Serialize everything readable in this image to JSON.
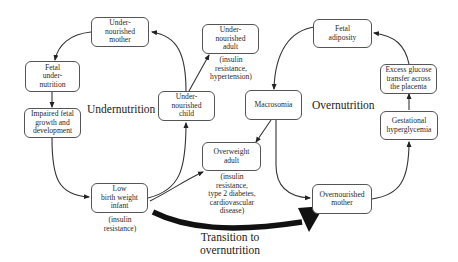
{
  "diagram": {
    "type": "cycle-flowchart",
    "sections": {
      "undernutrition": "Undernutrition",
      "overnutrition": "Overnutrition",
      "transition": [
        "Transition to",
        "overnutrition"
      ]
    },
    "nodes": {
      "undernourished_mother": [
        "Under-",
        "nourished",
        "mother"
      ],
      "fetal_undernutrition": [
        "Fetal",
        "under-",
        "nutrition"
      ],
      "impaired_fetal_growth": [
        "Impaired fetal",
        "growth and",
        "development"
      ],
      "low_birth_weight_infant": [
        "Low",
        "birth weight",
        "infant"
      ],
      "undernourished_child": [
        "Under-",
        "nourished",
        "child"
      ],
      "undernourished_adult": [
        "Under-",
        "nourished",
        "adult"
      ],
      "overweight_adult": [
        "Overweight",
        "adult"
      ],
      "macrosomia": [
        "Macrosomia"
      ],
      "fetal_adiposity": [
        "Fetal",
        "adiposity"
      ],
      "excess_glucose_transfer": [
        "Excess glucose",
        "transfer across",
        "the placenta"
      ],
      "gestational_hyperglycemia": [
        "Gestational",
        "hyperglycemia"
      ],
      "overnourished_mother": [
        "Overnourished",
        "mother"
      ]
    },
    "notes": {
      "low_birth_weight_infant": [
        "(insulin",
        "resistance)"
      ],
      "undernourished_adult": [
        "(insulin",
        "resistance,",
        "hypertension)"
      ],
      "overweight_adult": [
        "(insulin",
        "resistance,",
        "type 2 diabetes,",
        "cardiovascular",
        "disease)"
      ]
    },
    "edges": [
      {
        "from": "undernourished_mother",
        "to": "fetal_undernutrition"
      },
      {
        "from": "fetal_undernutrition",
        "to": "impaired_fetal_growth"
      },
      {
        "from": "impaired_fetal_growth",
        "to": "low_birth_weight_infant"
      },
      {
        "from": "low_birth_weight_infant",
        "to": "undernourished_child"
      },
      {
        "from": "undernourished_child",
        "to": "undernourished_mother"
      },
      {
        "from": "undernourished_child",
        "to": "undernourished_adult"
      },
      {
        "from": "low_birth_weight_infant",
        "to": "overweight_adult"
      },
      {
        "from": "low_birth_weight_infant",
        "to": "overnourished_mother",
        "style": "thick",
        "label": "Transition to overnutrition"
      },
      {
        "from": "overnourished_mother",
        "to": "gestational_hyperglycemia"
      },
      {
        "from": "gestational_hyperglycemia",
        "to": "excess_glucose_transfer"
      },
      {
        "from": "excess_glucose_transfer",
        "to": "fetal_adiposity"
      },
      {
        "from": "fetal_adiposity",
        "to": "macrosomia"
      },
      {
        "from": "macrosomia",
        "to": "overweight_adult"
      },
      {
        "from": "macrosomia",
        "to": "overnourished_mother"
      }
    ],
    "colors": {
      "line": "#333333",
      "box_border": "#555555",
      "text": "#2a2a2a",
      "background": "#ffffff"
    }
  }
}
